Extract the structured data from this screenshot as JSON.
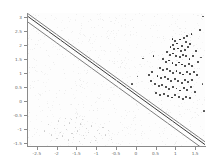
{
  "chart_data": {
    "type": "scatter",
    "title": "",
    "subtitle": "",
    "xlabel": "",
    "ylabel": "",
    "xlim": [
      -2.75,
      1.75
    ],
    "ylim": [
      -1.6,
      3.15
    ],
    "grid": false,
    "legend": null,
    "xticks": [
      -2.5,
      -2,
      -1.5,
      -1,
      -0.5,
      0,
      0.5,
      1,
      1.5
    ],
    "xticklabels": [
      "-2.5",
      "-2",
      "-1.5",
      "-1",
      "-0.5",
      "0",
      "0.5",
      "1",
      "1.5"
    ],
    "yticks": [
      -1.5,
      -1,
      -0.5,
      0,
      0.5,
      1,
      1.5,
      2,
      2.5,
      3
    ],
    "yticklabels": [
      "-1.5",
      "-1",
      "-0.5",
      "0",
      "0.5",
      "1",
      "1.5",
      "2",
      "2.5",
      "3"
    ],
    "annotations": [],
    "lines": [
      {
        "name": "decision-boundary",
        "style": "solid",
        "color": "#3a3a3a",
        "width": 1.0,
        "x": [
          -2.75,
          1.75
        ],
        "y": [
          3.05,
          -1.55
        ]
      },
      {
        "name": "upper-margin",
        "style": "solid",
        "color": "#6e6e6e",
        "width": 0.9,
        "x": [
          -2.75,
          1.75
        ],
        "y": [
          3.15,
          -1.45
        ]
      },
      {
        "name": "lower-margin",
        "style": "solid",
        "color": "#6e6e6e",
        "width": 0.9,
        "x": [
          -2.75,
          1.75
        ],
        "y": [
          2.85,
          -1.75
        ]
      }
    ],
    "series": [
      {
        "name": "cluster-class",
        "marker": "dot",
        "color": "#1c1c1c",
        "points": [
          [
            0.93,
            2.22
          ],
          [
            0.99,
            2.16
          ],
          [
            1.05,
            2.06
          ],
          [
            0.95,
            2.02
          ],
          [
            1.12,
            2.2
          ],
          [
            1.21,
            2.27
          ],
          [
            1.26,
            2.12
          ],
          [
            1.18,
            1.97
          ],
          [
            0.88,
            1.92
          ],
          [
            0.97,
            1.86
          ],
          [
            1.07,
            1.88
          ],
          [
            1.15,
            1.79
          ],
          [
            1.24,
            1.84
          ],
          [
            1.33,
            1.92
          ],
          [
            1.38,
            2.03
          ],
          [
            1.3,
            2.33
          ],
          [
            1.41,
            2.4
          ],
          [
            0.79,
            1.74
          ],
          [
            0.86,
            1.66
          ],
          [
            0.94,
            1.7
          ],
          [
            1.02,
            1.62
          ],
          [
            1.11,
            1.58
          ],
          [
            1.19,
            1.66
          ],
          [
            1.28,
            1.6
          ],
          [
            1.36,
            1.52
          ],
          [
            1.44,
            1.61
          ],
          [
            0.7,
            1.49
          ],
          [
            0.77,
            1.41
          ],
          [
            0.85,
            1.45
          ],
          [
            0.93,
            1.37
          ],
          [
            1.01,
            1.3
          ],
          [
            1.09,
            1.38
          ],
          [
            1.17,
            1.31
          ],
          [
            1.25,
            1.25
          ],
          [
            1.34,
            1.33
          ],
          [
            1.42,
            1.27
          ],
          [
            0.62,
            1.19
          ],
          [
            0.69,
            1.12
          ],
          [
            0.78,
            1.16
          ],
          [
            0.87,
            1.08
          ],
          [
            0.95,
            1.02
          ],
          [
            1.03,
            1.09
          ],
          [
            1.12,
            1.01
          ],
          [
            1.2,
            0.95
          ],
          [
            1.29,
            1.03
          ],
          [
            1.37,
            0.96
          ],
          [
            1.47,
            1.05
          ],
          [
            0.55,
            0.89
          ],
          [
            0.64,
            0.83
          ],
          [
            0.73,
            0.87
          ],
          [
            0.82,
            0.79
          ],
          [
            0.9,
            0.72
          ],
          [
            0.99,
            0.8
          ],
          [
            1.08,
            0.73
          ],
          [
            1.16,
            0.66
          ],
          [
            1.25,
            0.74
          ],
          [
            1.33,
            0.68
          ],
          [
            1.43,
            0.77
          ],
          [
            0.48,
            0.6
          ],
          [
            0.58,
            0.54
          ],
          [
            0.67,
            0.58
          ],
          [
            0.76,
            0.5
          ],
          [
            0.85,
            0.44
          ],
          [
            0.94,
            0.52
          ],
          [
            1.03,
            0.45
          ],
          [
            1.12,
            0.38
          ],
          [
            1.21,
            0.46
          ],
          [
            1.3,
            0.4
          ],
          [
            1.4,
            0.49
          ],
          [
            0.52,
            0.28
          ],
          [
            0.62,
            0.22
          ],
          [
            0.72,
            0.26
          ],
          [
            0.81,
            0.19
          ],
          [
            0.91,
            0.13
          ],
          [
            1.0,
            0.21
          ],
          [
            1.1,
            0.14
          ],
          [
            1.19,
            0.08
          ],
          [
            1.28,
            0.16
          ],
          [
            1.38,
            0.1
          ],
          [
            0.45,
            1.62
          ],
          [
            0.41,
            1.05
          ],
          [
            0.38,
            0.72
          ],
          [
            1.52,
            1.78
          ],
          [
            1.55,
            0.92
          ],
          [
            1.5,
            0.34
          ],
          [
            1.58,
            1.4
          ],
          [
            0.33,
            0.92
          ],
          [
            1.62,
            2.55
          ]
        ]
      },
      {
        "name": "noise-class",
        "marker": "dot",
        "color": "#c9c9c9",
        "points": [
          [
            -1.95,
            -0.72
          ],
          [
            -1.8,
            -0.88
          ],
          [
            -1.66,
            -0.79
          ],
          [
            -1.52,
            -0.95
          ],
          [
            -1.38,
            -0.83
          ],
          [
            -1.24,
            -1.0
          ],
          [
            -1.1,
            -0.9
          ],
          [
            -0.96,
            -1.06
          ],
          [
            -0.82,
            -0.94
          ],
          [
            -2.05,
            -0.98
          ],
          [
            -1.9,
            -1.12
          ],
          [
            -1.74,
            -1.02
          ],
          [
            -1.6,
            -1.18
          ],
          [
            -1.46,
            -1.08
          ],
          [
            -1.32,
            -1.24
          ],
          [
            -1.18,
            -1.13
          ],
          [
            -1.04,
            -1.28
          ],
          [
            -0.9,
            -1.17
          ],
          [
            -2.12,
            -1.22
          ],
          [
            -1.98,
            -1.34
          ],
          [
            -1.84,
            -1.26
          ],
          [
            -1.7,
            -1.4
          ],
          [
            -1.56,
            -1.31
          ],
          [
            -1.42,
            -1.45
          ],
          [
            -1.28,
            -1.36
          ],
          [
            -1.14,
            -1.5
          ],
          [
            -1.0,
            -1.41
          ],
          [
            -0.76,
            -1.22
          ],
          [
            -0.68,
            -1.05
          ],
          [
            -0.6,
            -1.38
          ],
          [
            -2.2,
            -0.85
          ],
          [
            -2.3,
            -1.08
          ],
          [
            -1.34,
            -0.66
          ],
          [
            -1.48,
            -0.6
          ],
          [
            -1.62,
            -0.68
          ],
          [
            -1.76,
            -0.62
          ]
        ]
      },
      {
        "name": "outliers",
        "marker": "dot",
        "color": "#4a4a4a",
        "points": [
          [
            1.7,
            3.02
          ],
          [
            1.66,
            1.55
          ],
          [
            1.69,
            0.6
          ],
          [
            0.18,
            1.52
          ],
          [
            0.05,
            0.88
          ],
          [
            -0.1,
            0.6
          ],
          [
            1.72,
            -0.35
          ]
        ]
      }
    ],
    "background_speckle": true
  }
}
